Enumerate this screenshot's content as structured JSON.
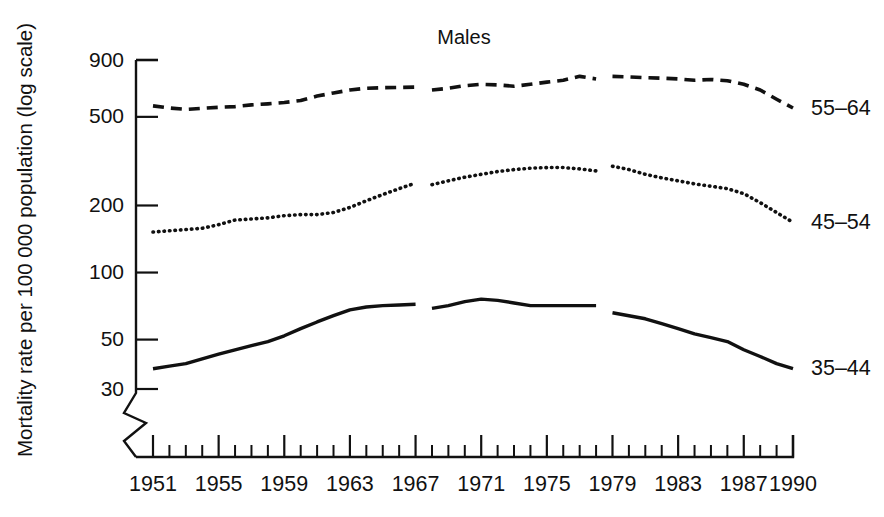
{
  "chart_data": {
    "type": "line",
    "title": "Males",
    "xlabel": "",
    "ylabel": "Mortality rate per 100 000 population (log scale)",
    "scale": "log",
    "grid": false,
    "axis_break_y": true,
    "legend_position": "right-of-lines",
    "ylim": [
      30,
      900
    ],
    "yticks": [
      900,
      500,
      200,
      100,
      50,
      30
    ],
    "ytick_labels": [
      "900",
      "500",
      "200",
      "100",
      "50",
      "30"
    ],
    "xlim": [
      1951,
      1990
    ],
    "xticks": [
      1951,
      1955,
      1959,
      1963,
      1967,
      1971,
      1975,
      1979,
      1983,
      1987,
      1990
    ],
    "xtick_labels": [
      "1951",
      "1955",
      "1959",
      "1963",
      "1967",
      "1971",
      "1975",
      "1979",
      "1983",
      "1987",
      "1990"
    ],
    "x_minor_tick_interval": 1,
    "series_breaks_after": [
      1967,
      1978
    ],
    "series": [
      {
        "name": "55-64",
        "label": "55–64",
        "style": "dashed",
        "color": "#111111",
        "x": [
          1951,
          1952,
          1953,
          1954,
          1955,
          1956,
          1957,
          1958,
          1959,
          1960,
          1961,
          1962,
          1963,
          1964,
          1965,
          1966,
          1967,
          1968,
          1969,
          1970,
          1971,
          1972,
          1973,
          1974,
          1975,
          1976,
          1977,
          1978,
          1979,
          1980,
          1981,
          1982,
          1983,
          1984,
          1985,
          1986,
          1987,
          1988,
          1989,
          1990
        ],
        "values": [
          560,
          548,
          540,
          546,
          552,
          556,
          566,
          572,
          580,
          592,
          620,
          640,
          660,
          672,
          676,
          678,
          680,
          660,
          672,
          690,
          700,
          696,
          686,
          700,
          716,
          730,
          760,
          740,
          760,
          756,
          750,
          746,
          740,
          730,
          736,
          726,
          700,
          660,
          600,
          548
        ]
      },
      {
        "name": "45-54",
        "label": "45–54",
        "style": "dotted",
        "color": "#111111",
        "x": [
          1951,
          1952,
          1953,
          1954,
          1955,
          1956,
          1957,
          1958,
          1959,
          1960,
          1961,
          1962,
          1963,
          1964,
          1965,
          1966,
          1967,
          1968,
          1969,
          1970,
          1971,
          1972,
          1973,
          1974,
          1975,
          1976,
          1977,
          1978,
          1979,
          1980,
          1981,
          1982,
          1983,
          1984,
          1985,
          1986,
          1987,
          1988,
          1989,
          1990
        ],
        "values": [
          152,
          154,
          156,
          158,
          164,
          172,
          174,
          176,
          180,
          182,
          182,
          186,
          196,
          210,
          224,
          238,
          252,
          248,
          258,
          268,
          276,
          284,
          290,
          294,
          296,
          296,
          292,
          286,
          300,
          290,
          276,
          266,
          258,
          250,
          244,
          238,
          226,
          206,
          186,
          168
        ]
      },
      {
        "name": "35-44",
        "label": "35–44",
        "style": "solid",
        "color": "#111111",
        "x": [
          1951,
          1952,
          1953,
          1954,
          1955,
          1956,
          1957,
          1958,
          1959,
          1960,
          1961,
          1962,
          1963,
          1964,
          1965,
          1966,
          1967,
          1968,
          1969,
          1970,
          1971,
          1972,
          1973,
          1974,
          1975,
          1976,
          1977,
          1978,
          1979,
          1980,
          1981,
          1982,
          1983,
          1984,
          1985,
          1986,
          1987,
          1988,
          1989,
          1990
        ],
        "values": [
          37,
          38,
          39,
          41,
          43,
          45,
          47,
          49,
          52,
          56,
          60,
          64,
          68,
          70,
          71,
          71.5,
          72,
          69,
          71,
          74,
          76,
          75,
          73,
          71,
          71,
          71,
          71,
          71,
          66,
          64,
          62,
          59,
          56,
          53,
          51,
          49,
          45,
          42,
          39,
          37
        ]
      }
    ]
  },
  "annotations": {
    "title": "Males",
    "y_axis_title": "Mortality rate per 100 000 population (log scale)",
    "series_labels": [
      "55–64",
      "45–54",
      "35–44"
    ]
  }
}
